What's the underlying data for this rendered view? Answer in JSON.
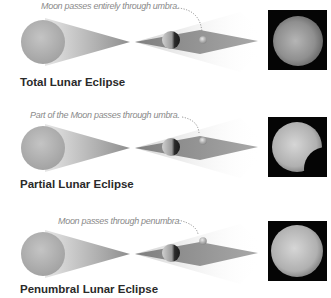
{
  "panels": [
    {
      "title": "Total Lunar Eclipse",
      "caption": "Moon passes entirely through umbra.",
      "moon_region": "umbra",
      "photo": "fully-eclipsed-moon"
    },
    {
      "title": "Partial Lunar Eclipse",
      "caption": "Part of the Moon passes through umbra.",
      "moon_region": "umbra-edge",
      "photo": "partially-eclipsed-moon"
    },
    {
      "title": "Penumbral Lunar Eclipse",
      "caption": "Moon passes through penumbra.",
      "moon_region": "penumbra",
      "photo": "penumbral-eclipsed-moon"
    }
  ],
  "labels": {
    "sun": "sun",
    "earth": "earth",
    "moon": "moon",
    "umbra": "umbra",
    "penumbra": "penumbra"
  },
  "colors": {
    "sun": "#b8b8b8",
    "cone": "#9a9a9a",
    "umbra": "#8c8c8c",
    "penumbra": "#d8d8d8",
    "photo_bg": "#050505",
    "caption": "#8a8a8a",
    "title": "#2a2a2a"
  }
}
